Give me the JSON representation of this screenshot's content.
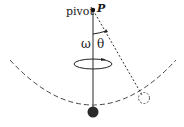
{
  "diagram": {
    "type": "conical pendulum",
    "labels": {
      "pivot": "pivot",
      "point": "P",
      "angular_velocity": "ω",
      "angle": "θ"
    },
    "colors": {
      "line": "#333333",
      "rod": "#555555",
      "bob": "#2a2a2a",
      "background": "#ffffff"
    }
  }
}
